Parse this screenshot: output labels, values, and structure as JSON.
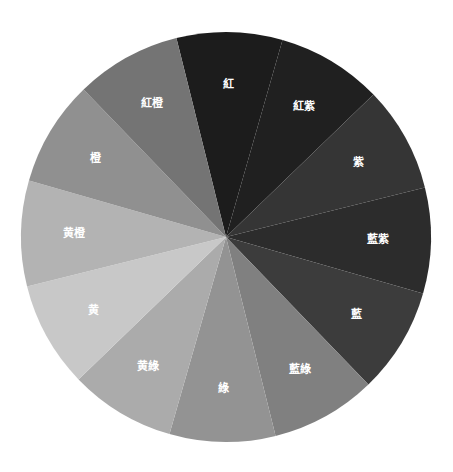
{
  "chart_data": {
    "type": "pie",
    "title": "",
    "start_angle_deg": -14,
    "direction": "clockwise",
    "legend": "none",
    "categories": [
      "紅",
      "紅紫",
      "紫",
      "藍紫",
      "藍",
      "藍綠",
      "綠",
      "黄綠",
      "黄",
      "黄橙",
      "橙",
      "紅橙"
    ],
    "values": [
      30,
      30,
      30,
      30,
      30,
      30,
      30,
      30,
      30,
      30,
      30,
      30
    ],
    "colors": [
      "#1c1c1c",
      "#202020",
      "#353535",
      "#2c2c2c",
      "#3c3c3c",
      "#808080",
      "#939393",
      "#ababab",
      "#c8c8c8",
      "#b3b3b3",
      "#909090",
      "#747474"
    ],
    "label_color": "#ffffff"
  },
  "layout": {
    "cx": 226,
    "cy": 237,
    "r": 205,
    "label_r": 0.74
  }
}
